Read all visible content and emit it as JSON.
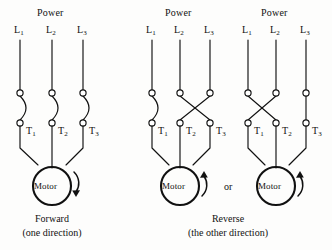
{
  "figure": {
    "type": "electrical-schematic",
    "background_color": "#fdfdfc",
    "line_color": "#111111"
  },
  "panels": [
    {
      "id": "forward",
      "power_label": "Power",
      "line_labels": [
        "L",
        "L",
        "L"
      ],
      "line_subscripts": [
        "1",
        "2",
        "3"
      ],
      "terminal_labels": [
        "T",
        "T",
        "T"
      ],
      "terminal_subscripts": [
        "1",
        "2",
        "3"
      ],
      "motor_label": "Motor",
      "rotation": "clockwise",
      "crossed_pair": "none",
      "caption_main": "Forward",
      "caption_sub": "(one direction)"
    },
    {
      "id": "reverse-a",
      "power_label": "Power",
      "line_labels": [
        "L",
        "L",
        "L"
      ],
      "line_subscripts": [
        "1",
        "2",
        "3"
      ],
      "terminal_labels": [
        "T",
        "T",
        "T"
      ],
      "terminal_subscripts": [
        "1",
        "2",
        "3"
      ],
      "motor_label": "Motor",
      "rotation": "counterclockwise",
      "crossed_pair": "L2-L3",
      "caption_main": "Reverse",
      "caption_sub": "(the other direction)"
    },
    {
      "id": "reverse-b",
      "power_label": "Power",
      "line_labels": [
        "L",
        "L",
        "L"
      ],
      "line_subscripts": [
        "1",
        "2",
        "3"
      ],
      "terminal_labels": [
        "T",
        "T",
        "T"
      ],
      "terminal_subscripts": [
        "1",
        "2",
        "3"
      ],
      "motor_label": "Motor",
      "rotation": "counterclockwise",
      "crossed_pair": "L1-L2",
      "caption_main": "Reverse",
      "caption_sub": "(the other direction)"
    }
  ],
  "connector": {
    "or_label": "or"
  }
}
